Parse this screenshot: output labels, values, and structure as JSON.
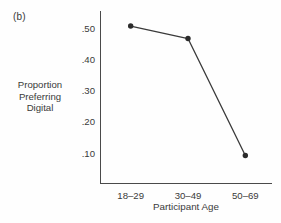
{
  "figure": {
    "panel_label": "(b)",
    "background_color": "#fefefe",
    "ink_color": "#3a3a3a"
  },
  "chart_data": {
    "type": "line",
    "title": "",
    "panel": "(b)",
    "categories": [
      "18–29",
      "30–49",
      "50–69"
    ],
    "values": [
      0.505,
      0.465,
      0.091
    ],
    "series": [
      {
        "name": "Proportion Preferring Digital",
        "values": [
          0.505,
          0.465,
          0.091
        ]
      }
    ],
    "xlabel": "Participant Age",
    "ylabel": "Proportion Preferring Digital",
    "ylabel_lines": [
      "Proportion",
      "Preferring",
      "Digital"
    ],
    "ytick_labels": [
      ".50",
      ".40",
      ".30",
      ".20",
      ".10"
    ],
    "ytick_values": [
      0.5,
      0.4,
      0.3,
      0.2,
      0.1
    ],
    "ylim": [
      0.0,
      0.553
    ],
    "grid": false,
    "legend": false,
    "legend_position": "none",
    "marker": "filled-circle",
    "line_color": "#3a3a3a",
    "marker_color": "#2b2b2b"
  }
}
